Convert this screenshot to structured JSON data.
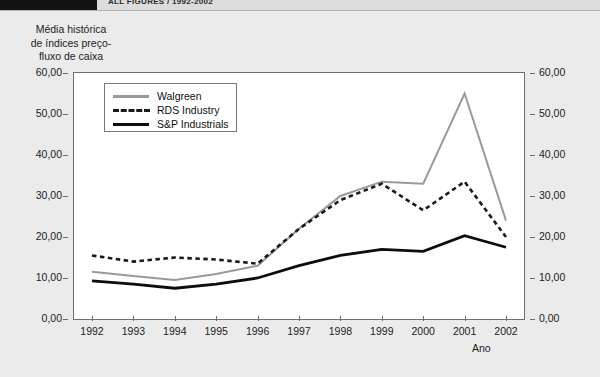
{
  "header": {
    "title": "ALL FIGURES / 1992-2002"
  },
  "y_axis_title_lines": [
    "Média histórica",
    "de índices preço-",
    "fluxo de caixa"
  ],
  "x_axis_title": "Ano",
  "legend": {
    "items": [
      {
        "label": "Walgreen",
        "style": "solid",
        "color": "#9a9a9a"
      },
      {
        "label": "RDS Industry",
        "style": "dashed",
        "color": "#1a1a1a"
      },
      {
        "label": "S&P Industrials",
        "style": "solid",
        "color": "#0d0d0d"
      }
    ]
  },
  "chart_data": {
    "type": "line",
    "xlabel": "Ano",
    "ylabel": "Média histórica de índices preço-fluxo de caixa",
    "categories": [
      "1992",
      "1993",
      "1994",
      "1995",
      "1996",
      "1997",
      "1998",
      "1999",
      "2000",
      "2001",
      "2002"
    ],
    "ytick_labels": [
      "0,00",
      "10,00",
      "20,00",
      "30,00",
      "40,00",
      "50,00",
      "60,00"
    ],
    "ytick_values": [
      0,
      10,
      20,
      30,
      40,
      50,
      60
    ],
    "ylim": [
      0,
      60
    ],
    "grid": false,
    "legend_position": "top-left-inside",
    "dual_y_axis": true,
    "decimal_separator": ",",
    "series": [
      {
        "name": "Walgreen",
        "color": "#9a9a9a",
        "style": "solid",
        "values": [
          11.5,
          10.5,
          9.5,
          11.0,
          13.0,
          22.0,
          30.0,
          33.5,
          33.0,
          55.0,
          24.0
        ]
      },
      {
        "name": "RDS Industry",
        "color": "#1a1a1a",
        "style": "dashed",
        "values": [
          15.5,
          14.0,
          15.0,
          14.5,
          13.5,
          22.0,
          29.0,
          33.0,
          26.5,
          33.5,
          20.0
        ]
      },
      {
        "name": "S&P Industrials",
        "color": "#0d0d0d",
        "style": "solid",
        "values": [
          9.3,
          8.5,
          7.5,
          8.5,
          10.0,
          13.0,
          15.5,
          17.0,
          16.5,
          20.3,
          17.5
        ]
      }
    ]
  }
}
